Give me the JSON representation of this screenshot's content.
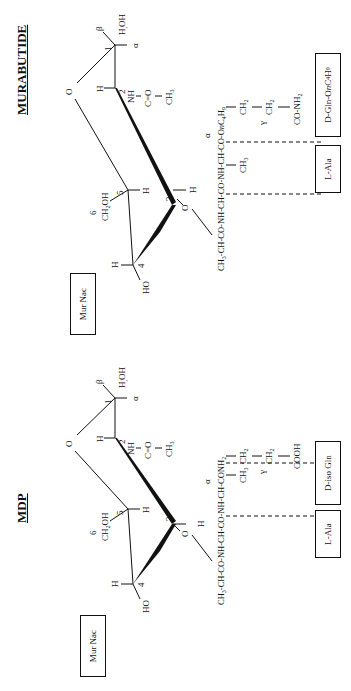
{
  "figure": {
    "orientation": "rotated -90 degrees",
    "panels": [
      {
        "id": "mdp",
        "title": "MDP",
        "sugar_box": "Mur Nac",
        "ring_labels": {
          "ring_oxygen": "O",
          "c1": "1",
          "c2": "2",
          "c3": "3",
          "c4": "4",
          "c5": "5",
          "c6": "6",
          "beta": "β",
          "alpha": "α",
          "h_oh": "H,OH",
          "c2_h": "H",
          "nh": "NH",
          "co": "C=O",
          "ch3_acetyl": "CH3",
          "c3_o": "O",
          "c3_h": "H",
          "c4_h": "H",
          "c4_ho": "HO",
          "c5_h": "H",
          "ch2oh": "CH2OH"
        },
        "chain": "CH3-CH-CO-NH-CH-CO-NH-CH-CONH2",
        "chain_alpha": "α",
        "ala_side": "CH3",
        "gln_side": [
          "CH2",
          "CH2",
          "COOH"
        ],
        "gamma": "γ",
        "residue_boxes": [
          "L-Ala",
          "D-iso Gln"
        ]
      },
      {
        "id": "murabutide",
        "title": "MURABUTIDE",
        "sugar_box": "Mur Nac",
        "ring_labels": {
          "ring_oxygen": "O",
          "c1": "1",
          "c2": "2",
          "c3": "3",
          "c4": "4",
          "c5": "5",
          "c6": "6",
          "beta": "β",
          "alpha": "α",
          "h_oh": "H,OH",
          "c2_h": "H",
          "nh": "NH",
          "co": "C=O",
          "ch3_acetyl": "CH3",
          "c3_o": "O",
          "c3_h": "H",
          "c4_h": "H",
          "c4_ho": "HO",
          "c5_h": "H",
          "ch2oh": "CH2OH"
        },
        "chain": "CH3-CH-CO-NH-CH-CO-NH-CH-CO-OnC4H9",
        "chain_alpha": "α",
        "ala_side": "CH3",
        "gln_side": [
          "CH2",
          "CH2",
          "CO-NH2"
        ],
        "gamma": "γ",
        "residue_boxes": [
          "L-Ala",
          "D-Gln-OnC4H9"
        ]
      }
    ]
  }
}
